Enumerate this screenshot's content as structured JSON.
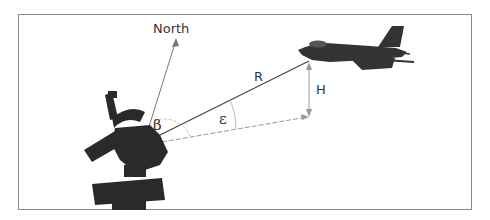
{
  "diagram": {
    "labels": {
      "north": "North",
      "range": "R",
      "height": "H",
      "azimuth": "β",
      "elevation": "ε"
    },
    "objects": {
      "radar": "radar-antenna",
      "aircraft": "fighter-jet"
    },
    "colors": {
      "frame": "#8a8a8a",
      "line": "#444444",
      "ground_line": "#999999",
      "silhouette": "#2a2a2a"
    }
  }
}
